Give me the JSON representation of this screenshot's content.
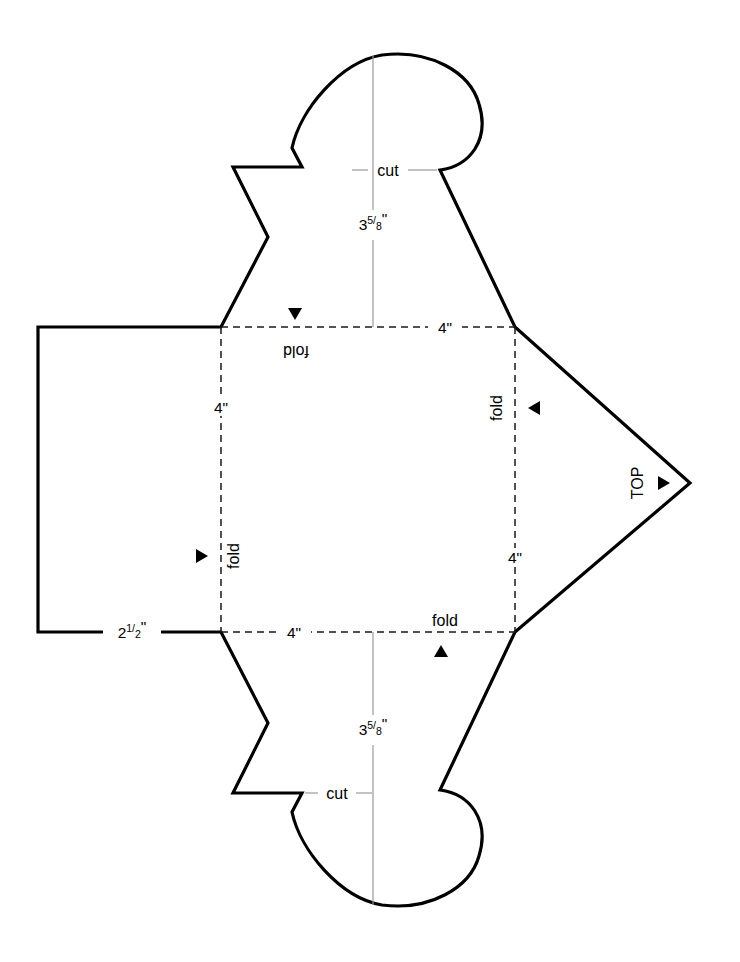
{
  "document": {
    "title": "Box Folding Pattern Template",
    "background_color": "#ffffff",
    "line_color": "#000000",
    "fold_line_color": "#1a1a1a",
    "dimension_line_color": "#9a9a9a"
  },
  "labels": {
    "cut_top": "cut",
    "cut_bottom": "cut",
    "fold_top": "fold",
    "fold_bottom": "fold",
    "fold_left": "fold",
    "fold_right": "fold",
    "top_marker": "TOP"
  },
  "dimensions": {
    "height_top_whole": "3",
    "height_top_numerator": "5",
    "height_top_slash": "/",
    "height_top_denominator": "8",
    "height_top_unit": "\"",
    "height_top_full": "3 5/8\"",
    "height_bottom_whole": "3",
    "height_bottom_numerator": "5",
    "height_bottom_slash": "/",
    "height_bottom_denominator": "8",
    "height_bottom_unit": "\"",
    "height_bottom_full": "3 5/8\"",
    "square_top": "4\"",
    "square_bottom": "4\"",
    "square_left": "4\"",
    "square_right": "4\"",
    "left_flap_whole": "2",
    "left_flap_numerator": "1",
    "left_flap_slash": "/",
    "left_flap_denominator": "2",
    "left_flap_unit": "\"",
    "left_flap_full": "2 1/2\""
  },
  "icons": {
    "fold_top_marker": "triangle-down-icon",
    "fold_bottom_marker": "triangle-up-icon",
    "fold_left_marker": "triangle-right-icon",
    "fold_right_marker": "triangle-left-icon",
    "top_point_marker": "triangle-right-icon"
  },
  "geometry": {
    "center_square": {
      "x": 221,
      "y": 327,
      "width": 294,
      "height": 305
    },
    "left_flap": {
      "x": 38,
      "y": 327,
      "width": 183,
      "height": 305
    },
    "top_point_apex": {
      "x": 690,
      "y": 483
    },
    "center_axis_x": 373,
    "mirror_axis_y": 480
  }
}
